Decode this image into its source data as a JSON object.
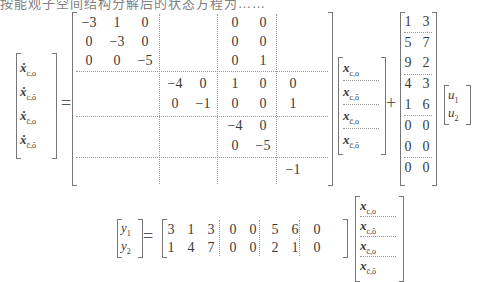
{
  "caption": "按能观子空间结构分解后的状态方程为……",
  "state_equation": {
    "lhs": [
      "ẋ_{c,o}",
      "ẋ_{c,ō}",
      "ẋ_{c̄,o}",
      "ẋ_{c̄,ō}"
    ],
    "lhs_labels": [
      {
        "base": "ẋ",
        "sub": "c,o"
      },
      {
        "base": "ẋ",
        "sub": "c,ō"
      },
      {
        "base": "ẋ",
        "sub": "c̄,o"
      },
      {
        "base": "ẋ",
        "sub": "c̄,ō"
      }
    ],
    "equals": "=",
    "plus": "+",
    "A": {
      "blocks": [
        3,
        2,
        2,
        1
      ],
      "rows": [
        [
          "−3",
          "1",
          "0",
          "",
          "",
          "0",
          "0",
          ""
        ],
        [
          "0",
          "−3",
          "0",
          "",
          "",
          "0",
          "0",
          ""
        ],
        [
          "0",
          "0",
          "−5",
          "",
          "",
          "0",
          "1",
          ""
        ],
        [
          "",
          "",
          "",
          "−4",
          "0",
          "1",
          "0",
          "0"
        ],
        [
          "",
          "",
          "",
          "0",
          "−1",
          "0",
          "0",
          "1"
        ],
        [
          "",
          "",
          "",
          "",
          "",
          "−4",
          "0",
          ""
        ],
        [
          "",
          "",
          "",
          "",
          "",
          "0",
          "−5",
          ""
        ],
        [
          "",
          "",
          "",
          "",
          "",
          "",
          "",
          "−1"
        ]
      ]
    },
    "x": [
      {
        "base": "x",
        "sub": "c,o"
      },
      {
        "base": "x",
        "sub": "c,ō"
      },
      {
        "base": "x",
        "sub": "c̄,o"
      },
      {
        "base": "x",
        "sub": "c̄,ō"
      }
    ],
    "B": {
      "rows": [
        [
          "1",
          "3"
        ],
        [
          "5",
          "7"
        ],
        [
          "9",
          "2"
        ],
        [
          "4",
          "3"
        ],
        [
          "1",
          "6"
        ],
        [
          "0",
          "0"
        ],
        [
          "0",
          "0"
        ],
        [
          "0",
          "0"
        ]
      ]
    },
    "u": [
      {
        "base": "u",
        "sub": "1"
      },
      {
        "base": "u",
        "sub": "2"
      }
    ]
  },
  "output_equation": {
    "y": [
      {
        "base": "y",
        "sub": "1"
      },
      {
        "base": "y",
        "sub": "2"
      }
    ],
    "equals": "=",
    "C": {
      "blocks": [
        3,
        2,
        2,
        1
      ],
      "rows": [
        [
          "3",
          "1",
          "3",
          "0",
          "0",
          "5",
          "6",
          "0"
        ],
        [
          "1",
          "4",
          "7",
          "0",
          "0",
          "2",
          "1",
          "0"
        ]
      ]
    },
    "x": [
      {
        "base": "x",
        "sub": "c,o"
      },
      {
        "base": "x",
        "sub": "c,ō"
      },
      {
        "base": "x",
        "sub": "c̄,o"
      },
      {
        "base": "x",
        "sub": "c̄,ō"
      }
    ]
  }
}
